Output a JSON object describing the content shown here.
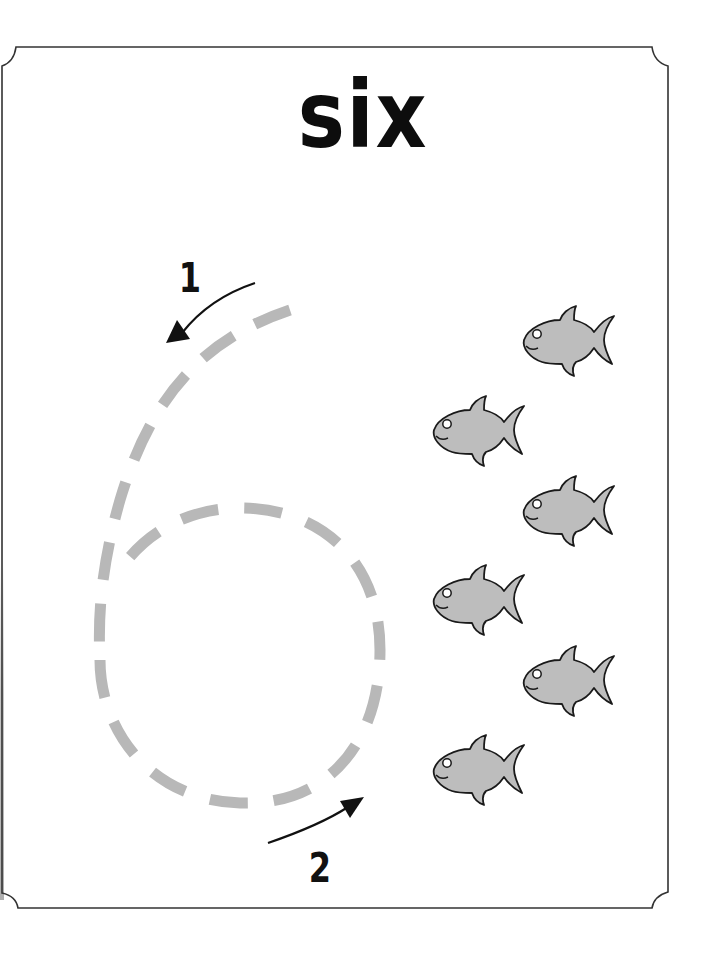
{
  "worksheet": {
    "title": "six",
    "numeral_traced": "6",
    "steps": [
      {
        "label": "1",
        "direction": "down-left"
      },
      {
        "label": "2",
        "direction": "up-right"
      }
    ],
    "fish_count": 6,
    "fish": [
      {
        "name": "fish-1",
        "x": 518,
        "y": 298
      },
      {
        "name": "fish-2",
        "x": 428,
        "y": 388
      },
      {
        "name": "fish-3",
        "x": 518,
        "y": 468
      },
      {
        "name": "fish-4",
        "x": 428,
        "y": 557
      },
      {
        "name": "fish-5",
        "x": 518,
        "y": 638
      },
      {
        "name": "fish-6",
        "x": 428,
        "y": 727
      }
    ],
    "colors": {
      "trace_dash": "#b8b8b8",
      "fish_fill": "#bdbdbd",
      "fish_outline": "#1a1a1a",
      "border": "#333333",
      "text": "#0d0d0d"
    }
  }
}
